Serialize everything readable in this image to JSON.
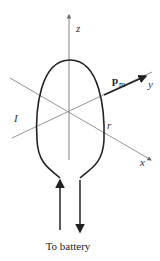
{
  "diagram": {
    "type": "current loop with magnetic dipole moment",
    "labels": {
      "z_axis": "z",
      "y_axis": "y",
      "x_axis": "x",
      "current": "I",
      "radius": "r",
      "moment_main": "p",
      "moment_sub": "m",
      "caption": "To battery"
    },
    "colors": {
      "axis": "#777777",
      "loop": "#222222",
      "text": "#222222",
      "background": "#ffffff"
    }
  }
}
